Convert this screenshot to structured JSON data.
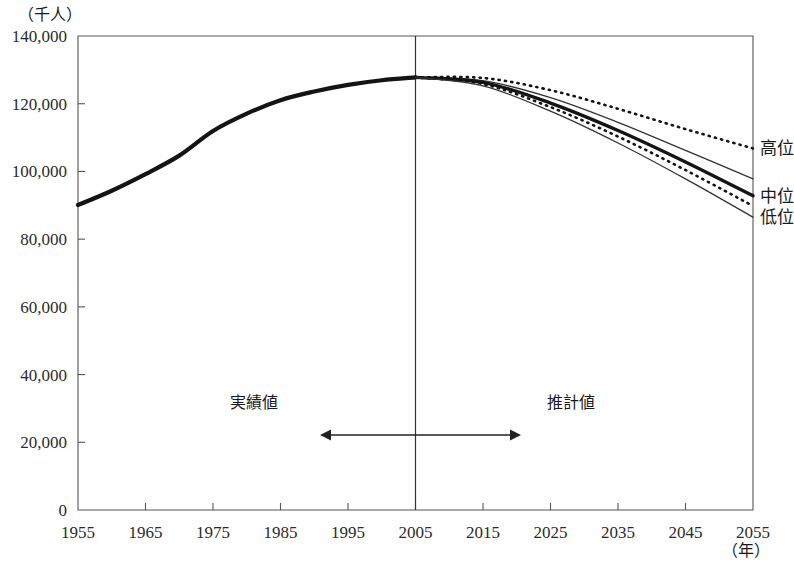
{
  "chart_data": {
    "type": "line",
    "title": "",
    "subtitle": "",
    "xlabel": "（年）",
    "ylabel": "（千人）",
    "xlim": [
      1955,
      2055
    ],
    "ylim": [
      0,
      140000
    ],
    "grid": false,
    "legend_position": "right-end-of-lines",
    "x_ticks": [
      "1955",
      "1965",
      "1975",
      "1985",
      "1995",
      "2005",
      "2015",
      "2025",
      "2035",
      "2045",
      "2055"
    ],
    "x_tick_values": [
      1955,
      1965,
      1975,
      1985,
      1995,
      2005,
      2015,
      2025,
      2035,
      2045,
      2055
    ],
    "y_ticks": [
      "0",
      "20,000",
      "40,000",
      "60,000",
      "80,000",
      "100,000",
      "120,000",
      "140,000"
    ],
    "y_tick_values": [
      0,
      20000,
      40000,
      60000,
      80000,
      100000,
      120000,
      140000
    ],
    "divider_year": 2005,
    "annotations": [
      {
        "name": "actual-region",
        "label": "実績値",
        "x": 1981
      },
      {
        "name": "estimate-region",
        "label": "推計値",
        "x": 2028
      }
    ],
    "series": [
      {
        "name": "実績値",
        "label": "",
        "style": "solid-thick",
        "x": [
          1955,
          1960,
          1965,
          1970,
          1975,
          1980,
          1985,
          1990,
          1995,
          2000,
          2005
        ],
        "values": [
          90077,
          94302,
          99209,
          104665,
          111940,
          117060,
          121049,
          123611,
          125570,
          126926,
          127768
        ]
      },
      {
        "name": "高位",
        "label": "高位",
        "style": "dotted-upper",
        "x": [
          2005,
          2015,
          2025,
          2035,
          2045,
          2055
        ],
        "values": [
          127768,
          127600,
          124000,
          118500,
          112500,
          106800
        ]
      },
      {
        "name": "高位-補助",
        "label": "",
        "style": "solid-thin-upper",
        "x": [
          2005,
          2015,
          2025,
          2035,
          2045,
          2055
        ],
        "values": [
          127768,
          126800,
          121800,
          114500,
          106200,
          97800
        ]
      },
      {
        "name": "中位",
        "label": "中位",
        "style": "solid-thick-middle",
        "x": [
          2005,
          2015,
          2025,
          2035,
          2045,
          2055
        ],
        "values": [
          127768,
          126300,
          120200,
          112100,
          102800,
          92800
        ]
      },
      {
        "name": "中位-補助",
        "label": "",
        "style": "dotted-lower",
        "x": [
          2005,
          2015,
          2025,
          2035,
          2045,
          2055
        ],
        "values": [
          127768,
          125800,
          119000,
          110300,
          100400,
          89800
        ]
      },
      {
        "name": "低位",
        "label": "低位",
        "style": "solid-thin-lower",
        "x": [
          2005,
          2015,
          2025,
          2035,
          2045,
          2055
        ],
        "values": [
          127768,
          125300,
          117800,
          108400,
          97800,
          86500
        ]
      }
    ]
  },
  "colors": {
    "background": "#ffffff",
    "line": "#141414",
    "axis": "#555555",
    "text": "#1a1a1a"
  }
}
